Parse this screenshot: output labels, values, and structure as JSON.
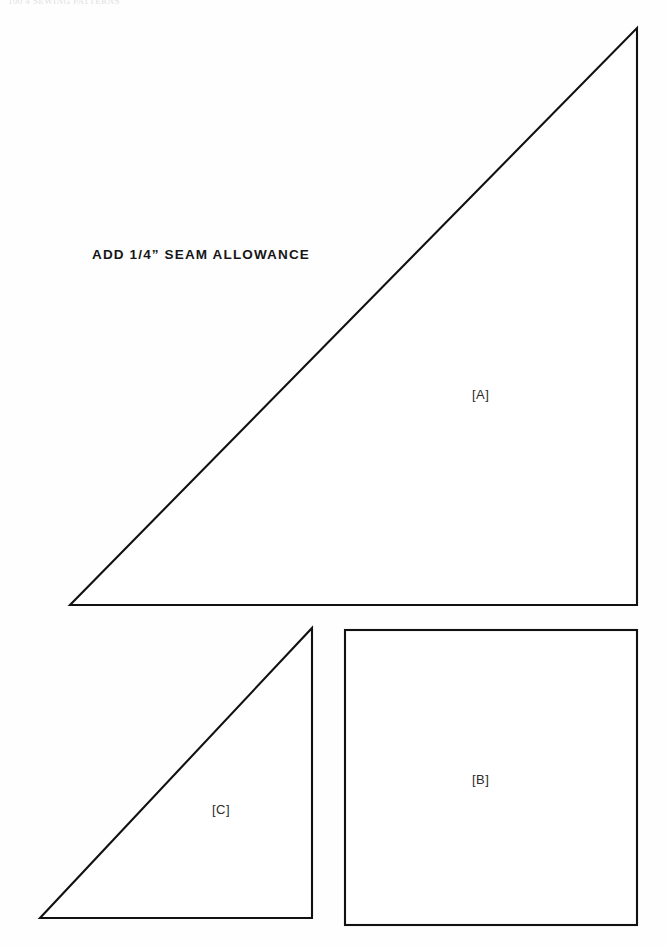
{
  "page": {
    "width": 668,
    "height": 948,
    "background_color": "#fefefe",
    "ink_color": "#111111",
    "running_head": "100  4  SEWING PATTERNS"
  },
  "instructions": {
    "seam_allowance_note": "ADD 1/4” SEAM ALLOWANCE"
  },
  "pieces": [
    {
      "id": "A",
      "label": "[A]",
      "shape": "right-triangle",
      "description": "Large right triangle, right angle at lower right",
      "points": "70,605 637,605 637,28",
      "label_position": {
        "x": 472,
        "y": 387
      }
    },
    {
      "id": "B",
      "label": "[B]",
      "shape": "square",
      "description": "Square piece at lower right",
      "rect": {
        "x": 345,
        "y": 630,
        "width": 292,
        "height": 295
      },
      "label_position": {
        "x": 472,
        "y": 772
      }
    },
    {
      "id": "C",
      "label": "[C]",
      "shape": "right-triangle",
      "description": "Small right triangle, right angle at lower right",
      "points": "40,918 312,918 312,628",
      "label_position": {
        "x": 212,
        "y": 802
      }
    }
  ],
  "style": {
    "stroke_width": 2.1,
    "stroke_color": "#111111",
    "fill_color": "#ffffff"
  }
}
